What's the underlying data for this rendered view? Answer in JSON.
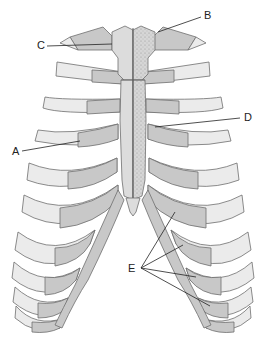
{
  "diagram": {
    "colors": {
      "bone_light": "#dcdcdc",
      "bone_mid": "#c8c8c8",
      "cartilage": "#ebebeb",
      "outline": "#6e6e6e",
      "stipple": "#8a8a8a",
      "leader_line": "#222222",
      "background": "#ffffff"
    },
    "labels": [
      {
        "id": "A",
        "text": "A",
        "x": 12,
        "y": 156,
        "target": [
          80,
          141
        ]
      },
      {
        "id": "B",
        "text": "B",
        "x": 204,
        "y": 20,
        "target": [
          158,
          32
        ]
      },
      {
        "id": "C",
        "text": "C",
        "x": 37,
        "y": 49,
        "target": [
          112,
          44
        ]
      },
      {
        "id": "D",
        "text": "D",
        "x": 244,
        "y": 123,
        "target": [
          155,
          127
        ]
      },
      {
        "id": "E",
        "text": "E",
        "x": 128,
        "y": 274,
        "targets": [
          [
            175,
            212
          ],
          [
            183,
            245
          ],
          [
            196,
            277
          ],
          [
            210,
            306
          ]
        ]
      }
    ]
  }
}
